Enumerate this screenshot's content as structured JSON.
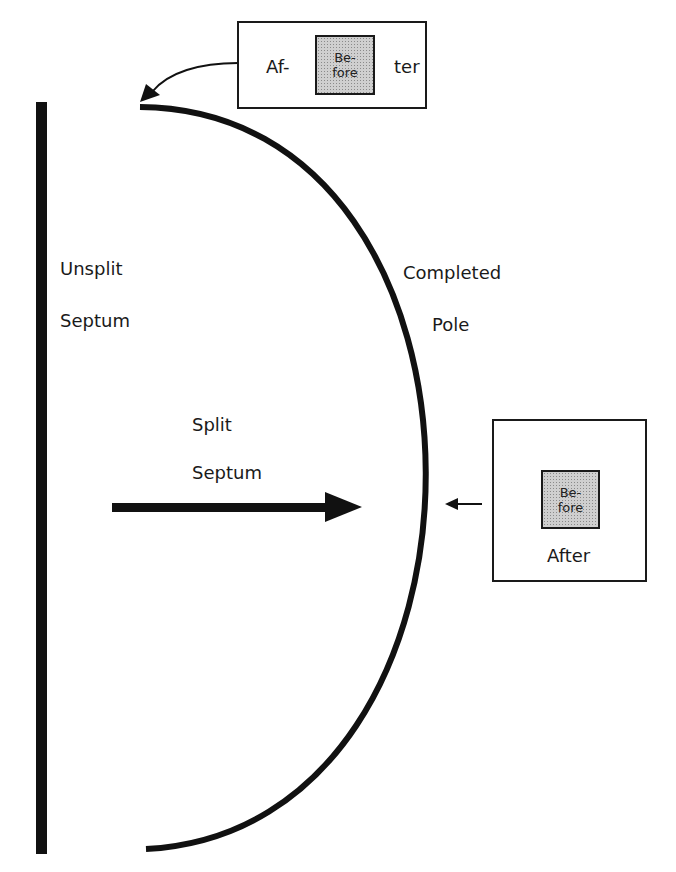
{
  "labels": {
    "unsplit_line1": "Unsplit",
    "unsplit_line2": "Septum",
    "completed_line1": "Completed",
    "completed_line2": "Pole",
    "split_line1": "Split",
    "split_line2": "Septum"
  },
  "top_box": {
    "left_text": "Af-",
    "inner_line1": "Be-",
    "inner_line2": "fore",
    "right_text": "ter"
  },
  "right_box": {
    "inner_line1": "Be-",
    "inner_line2": "fore",
    "bottom_text": "After"
  },
  "colors": {
    "stroke": "#111111",
    "inner_fill": "#cfcfcf",
    "background": "#ffffff"
  }
}
